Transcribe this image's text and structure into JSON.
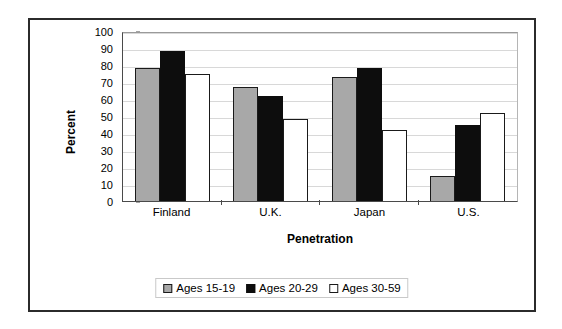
{
  "chart_data": {
    "type": "bar",
    "title": "",
    "xlabel": "Penetration",
    "ylabel": "Percent",
    "ylim": [
      0,
      100
    ],
    "ytick_step": 10,
    "yticks": [
      100,
      90,
      80,
      70,
      60,
      50,
      40,
      30,
      20,
      10,
      0
    ],
    "grid": true,
    "legend_position": "bottom",
    "categories": [
      "Finland",
      "U.K.",
      "Japan",
      "U.S."
    ],
    "series": [
      {
        "name": "Ages 15-19",
        "color": "#a8a8a8",
        "values": [
          78,
          67,
          73,
          15
        ]
      },
      {
        "name": "Ages 20-29",
        "color": "#0d0d0d",
        "values": [
          88,
          62,
          78,
          45
        ]
      },
      {
        "name": "Ages 30-59",
        "color": "#ffffff",
        "values": [
          75,
          48,
          42,
          52
        ]
      }
    ]
  }
}
